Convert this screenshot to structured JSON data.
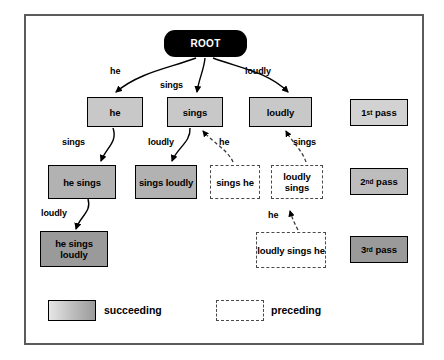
{
  "diagram": {
    "root": {
      "label": "ROOT"
    },
    "nodes": [
      {
        "id": "he",
        "label": "he",
        "kind": "succeeding",
        "pass": 1
      },
      {
        "id": "sings",
        "label": "sings",
        "kind": "succeeding",
        "pass": 1
      },
      {
        "id": "loudly",
        "label": "loudly",
        "kind": "succeeding",
        "pass": 1
      },
      {
        "id": "he-sings",
        "label": "he sings",
        "kind": "succeeding",
        "pass": 2
      },
      {
        "id": "sings-loudly",
        "label": "sings loudly",
        "kind": "succeeding",
        "pass": 2
      },
      {
        "id": "sings-he",
        "label": "sings he",
        "kind": "preceding",
        "pass": 2
      },
      {
        "id": "loudly-sings",
        "label": "loudly sings",
        "kind": "preceding",
        "pass": 2
      },
      {
        "id": "he-sings-loudly",
        "label": "he sings loudly",
        "kind": "succeeding",
        "pass": 3
      },
      {
        "id": "loudly-sings-he",
        "label": "loudly sings he",
        "kind": "preceding",
        "pass": 3
      }
    ],
    "edges": [
      {
        "from": "ROOT",
        "to": "he",
        "label": "he",
        "style": "solid"
      },
      {
        "from": "ROOT",
        "to": "sings",
        "label": "sings",
        "style": "solid"
      },
      {
        "from": "ROOT",
        "to": "loudly",
        "label": "loudly",
        "style": "solid"
      },
      {
        "from": "he",
        "to": "he-sings",
        "label": "sings",
        "style": "solid"
      },
      {
        "from": "sings",
        "to": "sings-loudly",
        "label": "loudly",
        "style": "solid"
      },
      {
        "from": "sings-he",
        "to": "sings",
        "label": "he",
        "style": "dashed"
      },
      {
        "from": "loudly-sings",
        "to": "loudly",
        "label": "sings",
        "style": "dashed"
      },
      {
        "from": "he-sings",
        "to": "he-sings-loudly",
        "label": "loudly",
        "style": "solid"
      },
      {
        "from": "loudly-sings-he",
        "to": "loudly-sings",
        "label": "he",
        "style": "dashed"
      }
    ],
    "passes": [
      {
        "ordinal": "1",
        "suffix": "st",
        "label": "pass"
      },
      {
        "ordinal": "2",
        "suffix": "nd",
        "label": "pass"
      },
      {
        "ordinal": "3",
        "suffix": "rd",
        "label": "pass"
      }
    ],
    "legend": [
      {
        "key": "succeeding",
        "label": "succeeding",
        "style": "filled-gradient"
      },
      {
        "key": "preceding",
        "label": "preceding",
        "style": "dashed-outline"
      }
    ],
    "colors": {
      "root_fill": "#000000",
      "root_text": "#ffffff",
      "succeeding_light": "#c8c8c8",
      "succeeding_mid": "#b2b2b2",
      "succeeding_dark": "#9a9a9a",
      "preceding_fill": "#ffffff",
      "preceding_border": "#4a4a4a",
      "frame_border": "#5b5b5b",
      "edge_stroke": "#000000"
    }
  }
}
